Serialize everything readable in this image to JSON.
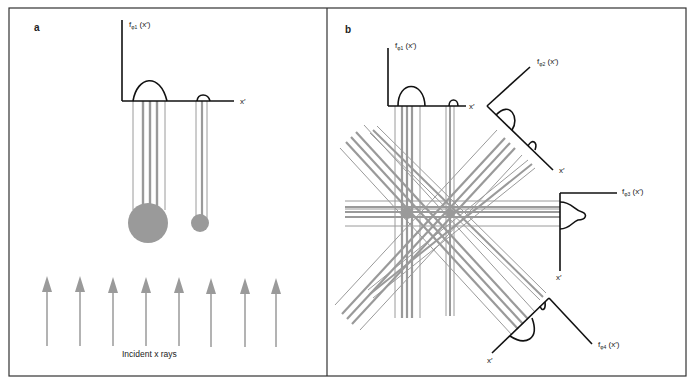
{
  "figure": {
    "panel_a": {
      "letter": "a",
      "axis_label_f": "f",
      "axis_label_sub": "φ1",
      "axis_label_arg": " (x′)",
      "axis_label_x": "x′",
      "incident_label": "Incident x rays"
    },
    "panel_b": {
      "letter": "b",
      "projections": [
        {
          "f": "f",
          "sub": "φ1",
          "arg": " (x′)",
          "x": "x′"
        },
        {
          "f": "f",
          "sub": "φ2",
          "arg": " (x′)",
          "x": "x′"
        },
        {
          "f": "f",
          "sub": "φ3",
          "arg": " (x′)",
          "x": "x′"
        },
        {
          "f": "f",
          "sub": "φ4",
          "arg": " (x′)",
          "x": "x′"
        }
      ]
    },
    "colors": {
      "ray": "#9a9a9a",
      "axis": "#111111",
      "object": "#9a9a9a",
      "frame": "#333333"
    }
  }
}
